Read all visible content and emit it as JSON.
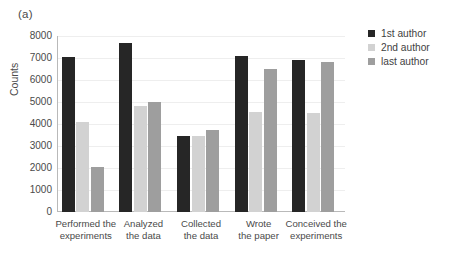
{
  "panel_label": "(a)",
  "legend": {
    "position": "right",
    "items": [
      {
        "label": "1st author",
        "color": "#262626"
      },
      {
        "label": "2nd author",
        "color": "#d2d2d2"
      },
      {
        "label": "last author",
        "color": "#9e9e9e"
      }
    ]
  },
  "chart_data": {
    "type": "bar",
    "title": "",
    "subtitle": "",
    "xlabel": "",
    "ylabel": "Counts",
    "ylim": [
      0,
      8000
    ],
    "yticks": [
      0,
      1000,
      2000,
      3000,
      4000,
      5000,
      6000,
      7000,
      8000
    ],
    "ytick_labels": [
      "0",
      "1000",
      "2000",
      "3000",
      "4000",
      "5000",
      "6000",
      "7000",
      "8000"
    ],
    "grid": "horizontal",
    "categories": [
      "Performed the experiments",
      "Analyzed the data",
      "Collected the data",
      "Wrote the paper",
      "Conceived the experiments"
    ],
    "category_lines": [
      [
        "Performed the",
        "experiments"
      ],
      [
        "Analyzed",
        "the data"
      ],
      [
        "Collected",
        "the data"
      ],
      [
        "Wrote",
        "the paper"
      ],
      [
        "Conceived the",
        "experiments"
      ]
    ],
    "series": [
      {
        "name": "1st author",
        "color": "#262626",
        "values": [
          7050,
          7700,
          3450,
          7100,
          6900
        ]
      },
      {
        "name": "2nd author",
        "color": "#d2d2d2",
        "values": [
          4100,
          4800,
          3450,
          4550,
          4500
        ]
      },
      {
        "name": "last author",
        "color": "#9e9e9e",
        "values": [
          2050,
          5000,
          3750,
          6500,
          6800
        ]
      }
    ]
  }
}
